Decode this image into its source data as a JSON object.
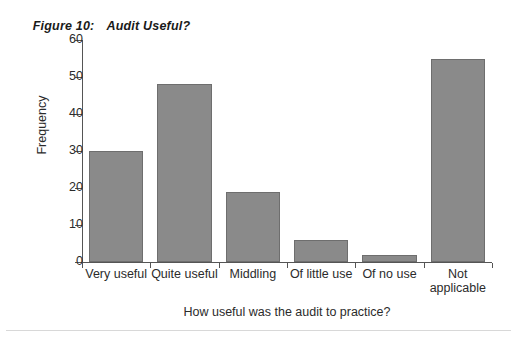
{
  "figure": {
    "number_label": "Figure 10:",
    "title": "Audit Useful?"
  },
  "chart_data": {
    "type": "bar",
    "title": "Audit Useful?",
    "xlabel": "How useful was the audit to practice?",
    "ylabel": "Frequency",
    "categories": [
      "Very useful",
      "Quite useful",
      "Middling",
      "Of little use",
      "Of no use",
      "Not\napplicable"
    ],
    "values": [
      30,
      48,
      19,
      6,
      2,
      55
    ],
    "ylim": [
      0,
      60
    ],
    "ytick_labels": [
      "60",
      "50",
      "40",
      "30",
      "20",
      "10",
      "0"
    ],
    "ytick_values": [
      60,
      50,
      40,
      30,
      20,
      10,
      0
    ],
    "grid": false,
    "legend": false,
    "bar_color": "#8a8a8a",
    "bar_edge_color": "#6e6e6e",
    "axis_color": "#555555",
    "text_color": "#2b2b2b",
    "background": "#ffffff"
  }
}
